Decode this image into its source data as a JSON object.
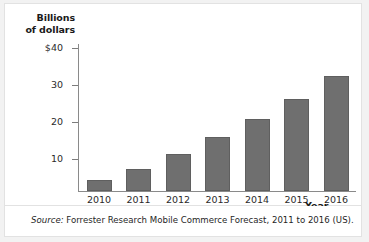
{
  "chart_data": {
    "type": "bar",
    "title": "",
    "xlabel": "Year",
    "ylabel": "Billions of dollars",
    "categories": [
      "2010",
      "2011",
      "2012",
      "2013",
      "2014",
      "2015",
      "2016"
    ],
    "values": [
      3,
      6,
      10,
      14.5,
      19.5,
      25,
      31
    ],
    "ylim": [
      0,
      44
    ],
    "yticks": [
      10,
      20,
      30,
      40
    ],
    "ytick_labels": [
      "10",
      "20",
      "30",
      "40"
    ],
    "ytick_top_label": "$40",
    "grid": false,
    "legend": null,
    "bar_color": "#6f6f6f"
  },
  "axes": {
    "y_title_line1": "Billions",
    "y_title_line2": "of dollars",
    "x_title": "Year",
    "y_labels": [
      "$40",
      "30",
      "20",
      "10"
    ],
    "x_labels": [
      "2010",
      "2011",
      "2012",
      "2013",
      "2014",
      "2015",
      "2016"
    ]
  },
  "source": {
    "label": "Source:",
    "text": "Forrester Research Mobile Commerce Forecast, 2011 to 2016 (US)."
  }
}
